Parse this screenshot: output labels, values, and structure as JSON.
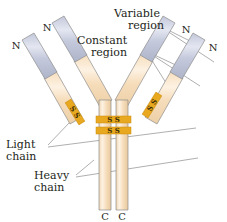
{
  "figure": {
    "background": "#ffffff",
    "width": 227,
    "height": 222
  },
  "colors": {
    "variable_region_fill": "#c6cbdd",
    "variable_region_highlight": "#dfe3ee",
    "constant_region_fill": "#f7dfbe",
    "constant_region_highlight": "#fdf1e0",
    "outline": "#8c8c8c",
    "disulfide_bar": "#e8a81f",
    "disulfide_bar_dark": "#c98a0d",
    "leader_line": "#8c8c8c",
    "text": "#231f20"
  },
  "labels": {
    "variable_region": {
      "line1": "Variable",
      "line2": "region"
    },
    "constant_region": {
      "line1": "Constant",
      "line2": "region"
    },
    "light_chain": {
      "line1": "Light",
      "line2": "chain"
    },
    "heavy_chain": {
      "line1": "Heavy",
      "line2": "chain"
    }
  },
  "termini": {
    "n_terminus_symbol": "N",
    "c_terminus_symbol": "C",
    "n_terminus_count": 4,
    "c_terminus_count": 2,
    "n_positions": [
      {
        "id": "n-far-left",
        "x": 16,
        "y": 45
      },
      {
        "id": "n-inner-left",
        "x": 47,
        "y": 27
      },
      {
        "id": "n-inner-right",
        "x": 186,
        "y": 30
      },
      {
        "id": "n-far-right",
        "x": 212,
        "y": 47
      }
    ],
    "c_positions": [
      {
        "id": "c-left",
        "x": 99,
        "y": 216
      },
      {
        "id": "c-right",
        "x": 126,
        "y": 216
      }
    ]
  },
  "disulfide_bonds": {
    "symbol": "S",
    "pair_label": "S S",
    "interchain_heavy_count": 2,
    "light_heavy_count": 2,
    "bonds": [
      {
        "id": "light-heavy-left",
        "label": "S S"
      },
      {
        "id": "light-heavy-right",
        "label": "S S"
      },
      {
        "id": "heavy-heavy-upper",
        "label": "S S"
      },
      {
        "id": "heavy-heavy-lower",
        "label": "S S"
      }
    ]
  },
  "chains": {
    "light_chain_count": 2,
    "heavy_chain_count": 2,
    "regions": [
      "Variable",
      "Constant"
    ]
  }
}
